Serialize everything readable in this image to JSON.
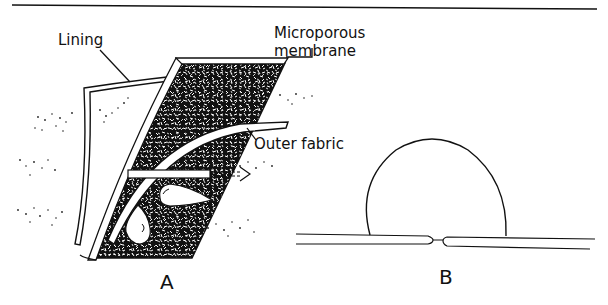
{
  "figure": {
    "panels": [
      {
        "id": "A",
        "label": "A",
        "description": "Cross-section of breathable fabric laminate",
        "annotations": {
          "lining": "Lining",
          "membrane_line1": "Microporous",
          "membrane_line2": "membrane",
          "outer_fabric": "Outer fabric"
        }
      },
      {
        "id": "B",
        "label": "B",
        "description": "Water droplet sitting on membrane surface over a pore"
      }
    ],
    "colors": {
      "ink": "#111111",
      "background": "#ffffff"
    }
  }
}
